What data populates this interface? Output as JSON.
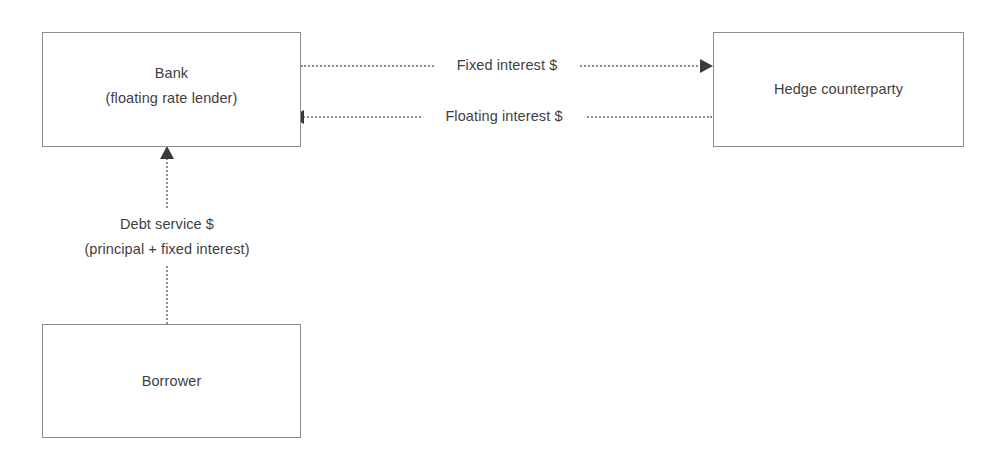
{
  "diagram": {
    "background_color": "#ffffff",
    "box_border_color": "#8c8c8c",
    "text_color": "#3f3f3f",
    "connector_color": "#8f8f8f",
    "arrowhead_color": "#3a3a3a",
    "nodes": [
      {
        "id": "bank",
        "label": "Bank\n(floating rate lender)"
      },
      {
        "id": "hedge",
        "label": "Hedge counterparty"
      },
      {
        "id": "borrower",
        "label": "Borrower"
      }
    ],
    "edges": [
      {
        "id": "fixed",
        "label": "Fixed interest $",
        "from": "bank",
        "to": "hedge",
        "direction": "right",
        "style": "dotted"
      },
      {
        "id": "floating",
        "label": "Floating interest $",
        "from": "hedge",
        "to": "bank",
        "direction": "left",
        "style": "dotted"
      },
      {
        "id": "debt",
        "label": "Debt service $\n(principal + fixed interest)",
        "from": "borrower",
        "to": "bank",
        "direction": "up",
        "style": "dotted"
      }
    ]
  }
}
